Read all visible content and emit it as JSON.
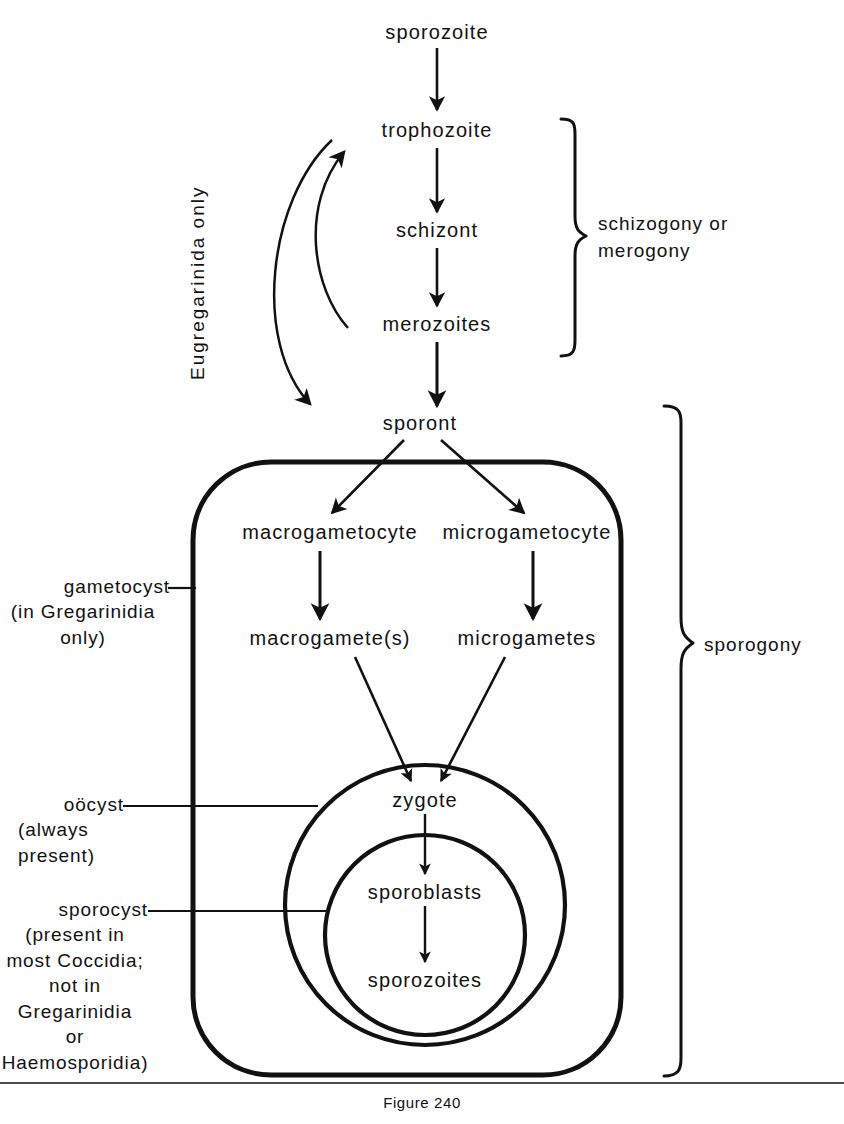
{
  "figure": {
    "caption": "Figure 240",
    "ink_color": "#111111",
    "background_color": "#ffffff"
  },
  "nodes": {
    "sporozoite_top": {
      "label": "sporozoite",
      "x": 437,
      "y": 33
    },
    "trophozoite": {
      "label": "trophozoite",
      "x": 437,
      "y": 131
    },
    "schizont": {
      "label": "schizont",
      "x": 437,
      "y": 231
    },
    "merozoites": {
      "label": "merozoites",
      "x": 437,
      "y": 325
    },
    "sporont": {
      "label": "sporont",
      "x": 420,
      "y": 424
    },
    "macrogametocyte": {
      "label": "macrogametocyte",
      "x": 330,
      "y": 533
    },
    "microgametocyte": {
      "label": "microgametocyte",
      "x": 527,
      "y": 533
    },
    "macrogamete": {
      "label": "macrogamete(s)",
      "x": 330,
      "y": 639
    },
    "microgametes": {
      "label": "microgametes",
      "x": 527,
      "y": 639
    },
    "zygote": {
      "label": "zygote",
      "x": 425,
      "y": 801
    },
    "sporoblasts": {
      "label": "sporoblasts",
      "x": 425,
      "y": 893
    },
    "sporozoites_inner": {
      "label": "sporozoites",
      "x": 425,
      "y": 981
    }
  },
  "annotations": {
    "eugregarinida": {
      "label": "Eugregarinida  only",
      "x": 187,
      "y": 380
    },
    "schizogony": {
      "label": "schizogony  or\nmerogony",
      "x": 628,
      "y": 238
    },
    "sporogony": {
      "label": "sporogony",
      "x": 710,
      "y": 645
    },
    "gametocyst": {
      "label": "gametocyst",
      "sub": "(in Gregarinidia\nonly)",
      "x": 160,
      "y": 588
    },
    "oocyst": {
      "label": "oöcyst",
      "sub": "(always\n    present)",
      "x": 160,
      "y": 806
    },
    "sporocyst": {
      "label": "sporocyst",
      "sub": "(present in\nmost Coccidia;\n    not  in\nGregarinidia\n      or\nHaemosporidia)",
      "x": 160,
      "y": 911
    }
  },
  "shapes": {
    "gametocyst_boundary": {
      "name": "rounded-rectangle",
      "x": 193,
      "y": 462,
      "width": 428,
      "height": 613,
      "radius": 78
    },
    "oocyst_circle": {
      "name": "circle",
      "cx": 425,
      "cy": 905,
      "r": 140
    },
    "sporocyst_circle": {
      "name": "circle",
      "cx": 425,
      "cy": 935,
      "r": 100
    }
  },
  "flow_steps": [
    "sporozoite",
    "trophozoite",
    "schizont",
    "merozoites",
    "sporont",
    "macrogametocyte / microgametocyte",
    "macrogamete(s) / microgametes",
    "zygote",
    "sporoblasts",
    "sporozoites"
  ]
}
